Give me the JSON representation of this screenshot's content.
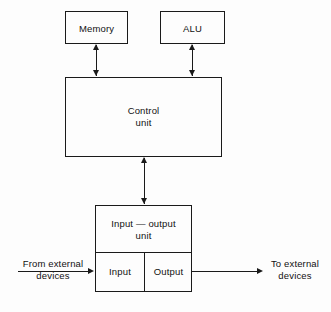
{
  "diagram": {
    "background_color": "#fdfdfd",
    "line_color": "#1a1a1a",
    "text_color": "#111111",
    "blocks": {
      "memory": {
        "label": "Memory"
      },
      "alu": {
        "label": "ALU"
      },
      "control_unit": {
        "label": "Control\nunit"
      },
      "io_unit": {
        "label": "Input — output\nunit"
      },
      "input": {
        "label": "Input"
      },
      "output": {
        "label": "Output"
      }
    },
    "external_labels": {
      "from_external": "From external\ndevices",
      "to_external": "To external\ndevices"
    },
    "connectors": [
      {
        "name": "memory-control-link",
        "type": "double-arrow",
        "orientation": "vertical",
        "from": "memory",
        "to": "control_unit"
      },
      {
        "name": "alu-control-link",
        "type": "double-arrow",
        "orientation": "vertical",
        "from": "alu",
        "to": "control_unit"
      },
      {
        "name": "control-io-link",
        "type": "double-arrow",
        "orientation": "vertical",
        "from": "control_unit",
        "to": "io_unit"
      },
      {
        "name": "external-input-link",
        "type": "single-arrow",
        "orientation": "horizontal",
        "from": "from_external",
        "to": "input"
      },
      {
        "name": "external-output-link",
        "type": "single-arrow",
        "orientation": "horizontal",
        "from": "output",
        "to": "to_external"
      }
    ]
  }
}
